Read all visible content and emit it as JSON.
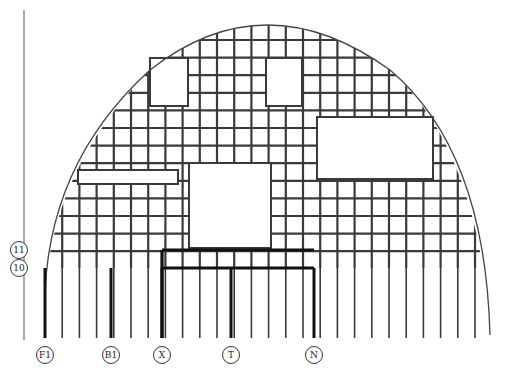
{
  "diagram": {
    "type": "structural-grid-plan",
    "line_color": "#3a3a3a",
    "background": "#ffffff",
    "column_axes": [
      {
        "label": "F1",
        "x": 45
      },
      {
        "label": "B1",
        "x": 111
      },
      {
        "label": "X",
        "x": 162
      },
      {
        "label": "T",
        "x": 231
      },
      {
        "label": "N",
        "x": 314
      }
    ],
    "row_axes": [
      {
        "label": "11",
        "y": 250
      },
      {
        "label": "10",
        "y": 268
      }
    ],
    "openings": [
      {
        "name": "upper-left-opening",
        "x": 150,
        "y": 58,
        "w": 38,
        "h": 48
      },
      {
        "name": "upper-mid-opening",
        "x": 266,
        "y": 58,
        "w": 36,
        "h": 48
      },
      {
        "name": "right-opening",
        "x": 317,
        "y": 117,
        "w": 116,
        "h": 62
      },
      {
        "name": "center-opening",
        "x": 189,
        "y": 163,
        "w": 82,
        "h": 85
      },
      {
        "name": "left-slot",
        "x": 78,
        "y": 170,
        "w": 100,
        "h": 14
      }
    ]
  }
}
